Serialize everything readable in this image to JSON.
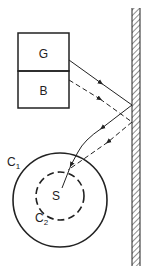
{
  "diagram": {
    "boxes": [
      {
        "id": "G",
        "label": "G"
      },
      {
        "id": "B",
        "label": "B"
      }
    ],
    "circles": [
      {
        "id": "C1",
        "label": "C",
        "subscript": "1",
        "style": "solid"
      },
      {
        "id": "C2",
        "label": "C",
        "subscript": "2",
        "style": "dashed"
      }
    ],
    "center_label": "S",
    "wall": {
      "style": "hatched"
    },
    "rays": [
      {
        "from": "G",
        "style": "solid",
        "reflects_off": "wall",
        "to": "S"
      },
      {
        "from": "B",
        "style": "dashed",
        "reflects_off": "wall",
        "to": "S"
      }
    ],
    "colors": {
      "stroke": "#222222",
      "background": "#ffffff"
    }
  }
}
